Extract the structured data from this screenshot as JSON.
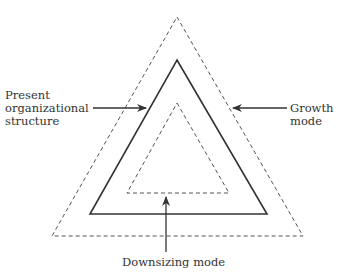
{
  "diagram": {
    "labels": {
      "present_line1": "Present",
      "present_line2": "organizational",
      "present_line3": "structure",
      "growth_line1": "Growth",
      "growth_line2": "mode",
      "downsizing": "Downsizing mode"
    },
    "shapes": {
      "outer_triangle": {
        "style": "dashed",
        "meaning": "Growth mode"
      },
      "middle_triangle": {
        "style": "solid",
        "meaning": "Present organizational structure"
      },
      "inner_triangle": {
        "style": "dashed",
        "meaning": "Downsizing mode"
      }
    },
    "colors": {
      "line": "#333333",
      "text": "#333333"
    }
  }
}
